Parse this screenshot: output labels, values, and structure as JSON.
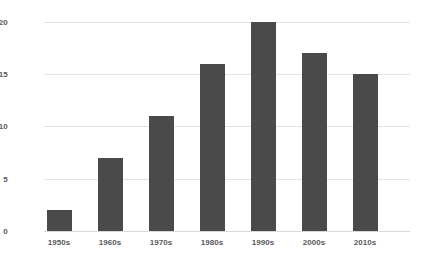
{
  "chart_data": {
    "type": "bar",
    "title": "",
    "subtitle": "",
    "xlabel": "",
    "ylabel": "",
    "categories": [
      "1950s",
      "1960s",
      "1970s",
      "1980s",
      "1990s",
      "2000s",
      "2010s"
    ],
    "values": [
      2,
      7,
      11,
      16,
      20,
      17,
      15
    ],
    "ylim": [
      0,
      20
    ],
    "y_ticks": [
      0,
      5,
      10,
      15,
      20
    ],
    "y_tick_labels": [
      "0",
      "5",
      "10",
      "15",
      "20"
    ],
    "grid": "horizontal",
    "legend": "none",
    "series": [
      {
        "name": "",
        "values": [
          2,
          7,
          11,
          16,
          20,
          17,
          15
        ]
      }
    ],
    "colors": {
      "bar": "#4a4a4a",
      "gridline": "#e3e3e3",
      "axis_line": "#d9d9d9",
      "tick_label": "#5a5a5a",
      "background": "#ffffff"
    }
  }
}
